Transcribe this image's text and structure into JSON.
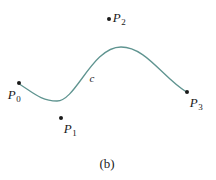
{
  "figure": {
    "caption": "(b)",
    "caption_position": {
      "x": 107,
      "y": 163
    },
    "canvas": {
      "width": 216,
      "height": 180,
      "background": "#ffffff"
    }
  },
  "curve": {
    "label": "c",
    "label_position": {
      "x": 92,
      "y": 78
    },
    "color": "#5f9490",
    "stroke_width": 1.3,
    "path": "M 18.5 83.5 C 33 92.5 41 101 57 101 C 76 101 92 47 121 47 C 146 47 163 78 186.5 92",
    "start_point": {
      "x": 18.5,
      "y": 83.5
    },
    "end_point": {
      "x": 186.5,
      "y": 92
    },
    "local_minimum": {
      "x": 57,
      "y": 101
    },
    "local_maximum": {
      "x": 121,
      "y": 47
    }
  },
  "control_points": [
    {
      "id": "P0",
      "label_letter": "P",
      "label_subscript": "0",
      "dot": {
        "x": 19,
        "y": 83
      },
      "label": {
        "x": 14,
        "y": 94
      }
    },
    {
      "id": "P1",
      "label_letter": "P",
      "label_subscript": "1",
      "dot": {
        "x": 61,
        "y": 118
      },
      "label": {
        "x": 70,
        "y": 128
      }
    },
    {
      "id": "P2",
      "label_letter": "P",
      "label_subscript": "2",
      "dot": {
        "x": 109,
        "y": 19
      },
      "label": {
        "x": 119,
        "y": 17
      }
    },
    {
      "id": "P3",
      "label_letter": "P",
      "label_subscript": "3",
      "dot": {
        "x": 187,
        "y": 92
      },
      "label": {
        "x": 196,
        "y": 102
      }
    }
  ],
  "chart_data": {
    "type": "line",
    "title": "(b)",
    "xlabel": "",
    "ylabel": "",
    "annotations": [
      "c",
      "P0",
      "P1",
      "P2",
      "P3"
    ],
    "series": [
      {
        "name": "c",
        "description": "cubic Bezier curve defined by control points P0, P1, P2, P3",
        "x": [
          18.5,
          57,
          92,
          121,
          186.5
        ],
        "y": [
          83.5,
          101,
          78,
          47,
          92
        ]
      },
      {
        "name": "control points",
        "x": [
          19,
          61,
          109,
          187
        ],
        "y": [
          83,
          118,
          19,
          92
        ]
      }
    ],
    "xlim": [
      0,
      216
    ],
    "ylim": [
      180,
      0
    ],
    "grid": false,
    "legend": "none"
  }
}
